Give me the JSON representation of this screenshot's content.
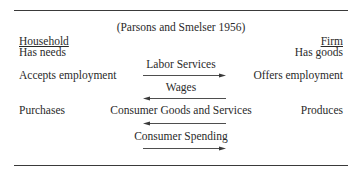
{
  "diagram": {
    "citation": "(Parsons and Smelser 1956)",
    "left_column": {
      "heading": "Household",
      "rows": [
        "Has needs",
        "Accepts employment",
        "Purchases"
      ]
    },
    "right_column": {
      "heading": "Firm",
      "rows": [
        "Has goods",
        "Offers employment",
        "Produces"
      ]
    },
    "flows": [
      {
        "label": "Labor Services",
        "direction": "right"
      },
      {
        "label": "Wages",
        "direction": "left"
      },
      {
        "label": "Consumer Goods and Services",
        "direction": "left"
      },
      {
        "label": "Consumer Spending",
        "direction": "right"
      }
    ],
    "colors": {
      "text": "#2a2a2a",
      "rule": "#3a3a3a",
      "background": "#ffffff"
    }
  }
}
